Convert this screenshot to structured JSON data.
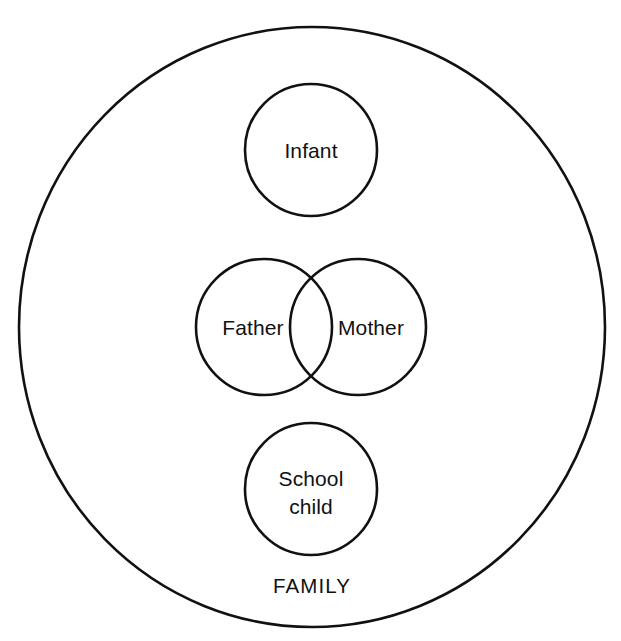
{
  "diagram": {
    "type": "venn-diagram",
    "title": "FAMILY",
    "background_color": "#ffffff",
    "stroke_color": "#111111",
    "outer_set": {
      "name": "family-set",
      "label": "FAMILY",
      "label_position": "inside-bottom",
      "cx": 312,
      "cy": 327,
      "rx": 293,
      "ry": 300,
      "stroke_width": 2.6
    },
    "inner_sets": [
      {
        "name": "infant",
        "label": "Infant",
        "label_lines": [
          "Infant"
        ],
        "cx": 311,
        "cy": 150,
        "r": 66,
        "stroke_width": 2.6,
        "overlaps": []
      },
      {
        "name": "father",
        "label": "Father",
        "label_lines": [
          "Father"
        ],
        "cx": 264,
        "cy": 327,
        "r": 68,
        "stroke_width": 2.6,
        "overlaps": [
          "mother"
        ]
      },
      {
        "name": "mother",
        "label": "Mother",
        "label_lines": [
          "Mother"
        ],
        "cx": 358,
        "cy": 327,
        "r": 68,
        "stroke_width": 2.6,
        "overlaps": [
          "father"
        ]
      },
      {
        "name": "school-child",
        "label": "School child",
        "label_lines": [
          "School",
          "child"
        ],
        "cx": 311,
        "cy": 489,
        "r": 66,
        "stroke_width": 2.6,
        "overlaps": []
      }
    ],
    "labels": {
      "infant": "Infant",
      "father": "Father",
      "mother": "Mother",
      "school_child_line1": "School",
      "school_child_line2": "child",
      "family": "FAMILY"
    }
  }
}
